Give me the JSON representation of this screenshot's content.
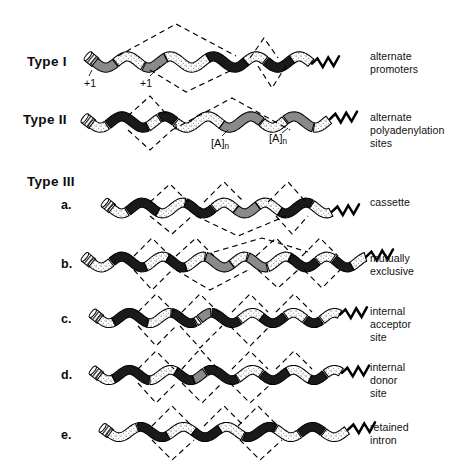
{
  "figure": {
    "caption_absent": true,
    "background": "#ffffff",
    "ink": "#000000"
  },
  "legend_colors": {
    "exon_dark": "#1a1a1a",
    "exon_mid_gray": "#8a8a8a",
    "exon_stipple_light": "#fbfbfb",
    "outline": "#000000",
    "dashed_splice": "#000000"
  },
  "rows": [
    {
      "id": "type-1",
      "type_label": "Type I",
      "sub_label": "",
      "right_label": "alternate\npromoters",
      "tick_labels": [
        "+1",
        "+1"
      ]
    },
    {
      "id": "type-2",
      "type_label": "Type II",
      "sub_label": "",
      "right_label": "alternate\npolyadenylation\nsites",
      "poly_labels": [
        "[A]n",
        "[A]n"
      ]
    },
    {
      "id": "type-3-a",
      "type_label": "Type III",
      "sub_label": "a.",
      "right_label": "cassette"
    },
    {
      "id": "type-3-b",
      "type_label": "",
      "sub_label": "b.",
      "right_label": "mutually\nexclusive"
    },
    {
      "id": "type-3-c",
      "type_label": "",
      "sub_label": "c.",
      "right_label": "internal\nacceptor\nsite"
    },
    {
      "id": "type-3-d",
      "type_label": "",
      "sub_label": "d.",
      "right_label": "internal\ndonor\nsite"
    },
    {
      "id": "type-3-e",
      "type_label": "",
      "sub_label": "e.",
      "right_label": "retained\nintron"
    }
  ],
  "poly_a": {
    "bracket_text": "[A]",
    "subscript": "n"
  }
}
